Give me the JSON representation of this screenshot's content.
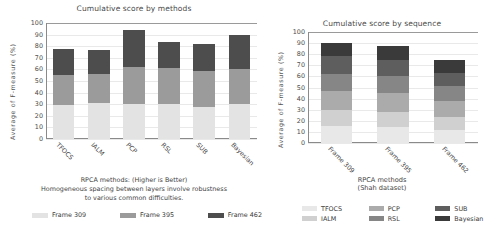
{
  "palette": {
    "seq_light": "#e3e3e3",
    "seq_mid": "#9b9b9b",
    "seq_dark": "#4d4d4d",
    "m1": "#e8e8e8",
    "m2": "#d0d0d0",
    "m3": "#ababab",
    "m4": "#868686",
    "m5": "#5e5e5e",
    "m6": "#3a3a3a",
    "axis": "#8a8a8a",
    "grid": "#e9e9e9",
    "text": "#3a3a3a"
  },
  "left_panel": {
    "title": "Cumulative score by methods",
    "ylabel": "Average of  F-measure  (%)",
    "caption_line1": "RPCA methods: (Higher is Better)",
    "caption_line2": "Homogeneous spacing between layers involve robustness",
    "caption_line3": "to various common difficulties.",
    "legend": [
      {
        "label": "Frame 309",
        "color": "#e3e3e3"
      },
      {
        "label": "Frame 395",
        "color": "#9b9b9b"
      },
      {
        "label": "Frame 462",
        "color": "#4d4d4d"
      }
    ]
  },
  "right_panel": {
    "title": "Cumulative score by sequence",
    "ylabel": "Average of  F-measure  (%)",
    "xlabel": "RPCA methods\n(Shah dataset)",
    "legend": [
      {
        "label": "TFOCS",
        "color": "#e8e8e8"
      },
      {
        "label": "PCP",
        "color": "#ababab"
      },
      {
        "label": "SUB",
        "color": "#5e5e5e"
      },
      {
        "label": "IALM",
        "color": "#d0d0d0"
      },
      {
        "label": "RSL",
        "color": "#868686"
      },
      {
        "label": "Bayesian",
        "color": "#3a3a3a"
      }
    ]
  },
  "chart_data": [
    {
      "id": "cumulative-score-by-methods",
      "type": "bar",
      "stacked": true,
      "title": "Cumulative score by methods",
      "xlabel": "RPCA methods: (Higher is Better)",
      "ylabel": "Average of  F-measure  (%)",
      "ylim": [
        0,
        100
      ],
      "yticks": [
        0,
        10,
        20,
        30,
        40,
        50,
        60,
        70,
        80,
        90,
        100
      ],
      "grid": true,
      "legend_position": "bottom",
      "categories": [
        "TFOCS",
        "IALM",
        "PCP",
        "RSL",
        "SUB",
        "Bayesian"
      ],
      "series": [
        {
          "name": "Frame 309",
          "color": "#e3e3e3",
          "values": [
            29,
            31,
            30,
            30,
            28,
            30
          ]
        },
        {
          "name": "Frame 395",
          "color": "#9b9b9b",
          "values": [
            26,
            25,
            32,
            31,
            31,
            30
          ]
        },
        {
          "name": "Frame 462",
          "color": "#4d4d4d",
          "values": [
            23,
            21,
            32,
            23,
            23,
            30
          ]
        }
      ],
      "totals": [
        78,
        77,
        94,
        84,
        82,
        90
      ]
    },
    {
      "id": "cumulative-score-by-sequence",
      "type": "bar",
      "stacked": true,
      "title": "Cumulative score by sequence",
      "xlabel": "RPCA methods (Shah dataset)",
      "ylabel": "Average of  F-measure  (%)",
      "ylim": [
        0,
        100
      ],
      "yticks": [
        0,
        10,
        20,
        30,
        40,
        50,
        60,
        70,
        80,
        90,
        100
      ],
      "grid": true,
      "legend_position": "bottom",
      "categories": [
        "Frame 309",
        "Frame 395",
        "Frame 462"
      ],
      "series": [
        {
          "name": "TFOCS",
          "color": "#e8e8e8",
          "values": [
            15,
            14,
            12
          ]
        },
        {
          "name": "IALM",
          "color": "#d0d0d0",
          "values": [
            15,
            14,
            11
          ]
        },
        {
          "name": "PCP",
          "color": "#ababab",
          "values": [
            17,
            17,
            15
          ]
        },
        {
          "name": "RSL",
          "color": "#868686",
          "values": [
            15,
            15,
            13
          ]
        },
        {
          "name": "SUB",
          "color": "#5e5e5e",
          "values": [
            16,
            15,
            12
          ]
        },
        {
          "name": "Bayesian",
          "color": "#3a3a3a",
          "values": [
            12,
            12,
            12
          ]
        }
      ],
      "totals": [
        90,
        87,
        75
      ]
    }
  ]
}
